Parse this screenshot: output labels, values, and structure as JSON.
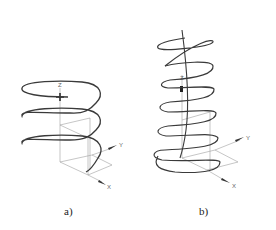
{
  "figures": [
    {
      "id": "a",
      "caption": "a)",
      "description": "Cylindrical helix, 3 turns, constant radius",
      "axes": {
        "x": "X",
        "y": "Y",
        "z": "Z"
      }
    },
    {
      "id": "b",
      "caption": "b)",
      "description": "Conical/curved-axis helix, ~7 turns, decreasing radius upward",
      "axes": {
        "x": "X",
        "y": "Y",
        "z": "Z"
      }
    }
  ],
  "colors": {
    "curve": "#3a3a3a",
    "axis": "#999999",
    "arrow": "#333333"
  }
}
